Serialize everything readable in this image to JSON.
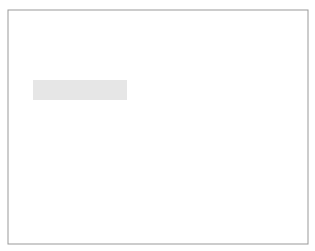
{
  "figure": {
    "panel_a": {
      "label": "(a)",
      "labels": {
        "card": "card",
        "plasticine": "plasticine",
        "glider1": "glider 1",
        "glider2": "glider 2"
      }
    },
    "panel_b": {
      "label": "(b)",
      "labels": {
        "spring": "spring",
        "cotton": "cotton"
      }
    },
    "colors": {
      "frame": "#999999",
      "track_fill": "#e6e6e6",
      "track_line": "#333333",
      "glider_fill": "#9a9a9a",
      "card_fill": "#e0e0e0"
    }
  }
}
